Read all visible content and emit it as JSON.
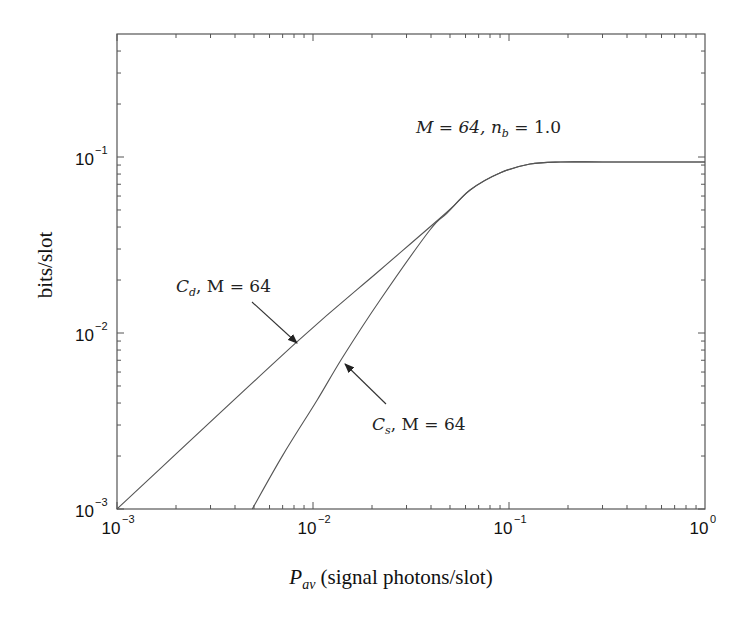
{
  "chart_data": {
    "type": "line",
    "title": "",
    "xlabel": "P_av (signal photons/slot)",
    "ylabel": "bits/slot",
    "xscale": "log",
    "yscale": "log",
    "xlim": [
      0.001,
      1
    ],
    "ylim": [
      0.001,
      0.5
    ],
    "grid": false,
    "legend": null,
    "x_ticks": [
      {
        "value": 0.001,
        "base": "10",
        "exp": "−3"
      },
      {
        "value": 0.01,
        "base": "10",
        "exp": "−2"
      },
      {
        "value": 0.1,
        "base": "10",
        "exp": "−1"
      },
      {
        "value": 1,
        "base": "10",
        "exp": "0"
      }
    ],
    "y_ticks": [
      {
        "value": 0.001,
        "base": "10",
        "exp": "−3"
      },
      {
        "value": 0.01,
        "base": "10",
        "exp": "−2"
      },
      {
        "value": 0.1,
        "base": "10",
        "exp": "−1"
      }
    ],
    "series": [
      {
        "name": "C_d, M = 64",
        "x": [
          0.001,
          0.00828,
          0.022,
          0.0483,
          0.0633,
          0.0899,
          0.128,
          0.183,
          0.3,
          0.6,
          1.0
        ],
        "y": [
          0.001,
          0.0089,
          0.0228,
          0.0487,
          0.0649,
          0.0811,
          0.0912,
          0.0937,
          0.0937,
          0.0937,
          0.0937
        ]
      },
      {
        "name": "C_s, M = 64",
        "x": [
          0.0049,
          0.00703,
          0.0105,
          0.0141,
          0.022,
          0.0395,
          0.0483,
          0.0633,
          0.0899,
          0.128,
          0.183,
          0.3,
          0.6,
          1.0
        ],
        "y": [
          0.001,
          0.00203,
          0.00416,
          0.00721,
          0.0154,
          0.0385,
          0.048,
          0.0649,
          0.0811,
          0.0912,
          0.0937,
          0.0937,
          0.0937,
          0.0937
        ]
      }
    ],
    "annotations": [
      {
        "id": "param",
        "main": "M = 64, n",
        "sub": "b",
        "tail": " = 1.0",
        "x_px": 416,
        "y_px": 133
      },
      {
        "id": "cd",
        "main": "C",
        "sub": "d",
        "tail": ", M = 64",
        "x_px": 176,
        "y_px": 292,
        "arrow_from": [
          252,
          302
        ],
        "arrow_to": [
          297,
          343
        ]
      },
      {
        "id": "cs",
        "main": "C",
        "sub": "s",
        "tail": ", M = 64",
        "x_px": 372,
        "y_px": 430,
        "arrow_from": [
          386,
          404
        ],
        "arrow_to": [
          345,
          364
        ]
      }
    ]
  },
  "axes": {
    "x_label_main": "P",
    "x_label_sub": "av",
    "x_label_tail": " (signal photons/slot)",
    "y_label": "bits/slot"
  }
}
